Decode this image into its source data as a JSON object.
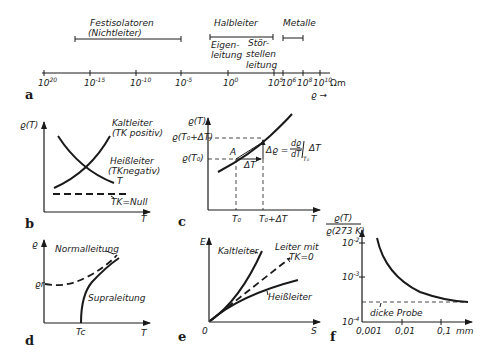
{
  "panels": {
    "a": {
      "label": "a",
      "ranges": {
        "insulators": {
          "line1": "Festisolatoren",
          "line2": "(Nichtleiter)"
        },
        "semiconductors": {
          "title": "Halbleiter",
          "sub1_line1": "Eigen-",
          "sub1_line2": "leitung",
          "sub2_line1": "Stör-",
          "sub2_line2": "stellen",
          "sub2_line3": "leitung"
        },
        "metals": {
          "title": "Metalle"
        }
      },
      "ticks": [
        {
          "base": "10",
          "exp": "20"
        },
        {
          "base": "10",
          "exp": "-15"
        },
        {
          "base": "10",
          "exp": "-10"
        },
        {
          "base": "10",
          "exp": "-5"
        },
        {
          "base": "10",
          "exp": "0"
        },
        {
          "base": "10",
          "exp": "5"
        },
        {
          "base": "10",
          "exp": "6"
        },
        {
          "base": "10",
          "exp": "8"
        },
        {
          "base": "10",
          "exp": "10"
        }
      ],
      "unit": "Ωm",
      "axis_symbol": "ϱ →"
    },
    "b": {
      "label": "b",
      "y_axis": "ϱ(T)",
      "x_axis": "T",
      "curves": {
        "kalt_line1": "Kaltleiter",
        "kalt_line2": "(TK positiv)",
        "heiss_line1": "Heißleiter",
        "heiss_line2": "(TKnegativ)",
        "heiss_line3": "T",
        "null": "TK=Null"
      }
    },
    "c": {
      "label": "c",
      "y_axis": "ϱ(T)",
      "x_axis": "T",
      "y_tick_upper": "ϱ(T₀+ΔT)",
      "y_tick_lower": "ϱ(T₀)",
      "x_tick_1": "T₀",
      "x_tick_2": "T₀+ΔT",
      "point": "A",
      "delta_t": "ΔT",
      "delta_rho": "Δϱ =",
      "derivative_num": "dϱ",
      "derivative_den": "dT",
      "derivative_sub": "T₀",
      "derivative_tail": "ΔT"
    },
    "d": {
      "label": "d",
      "y_axis": "ϱ",
      "x_axis": "T",
      "y_tick": "ϱr",
      "x_tick": "Tc",
      "normal": "Normalleitung",
      "supra": "Supraleitung"
    },
    "e": {
      "label": "e",
      "y_axis": "E",
      "x_axis": "S",
      "origin": "0",
      "kalt": "Kaltleiter",
      "leiter_line1": "Leiter mit",
      "leiter_line2": "TK=0",
      "heiss": "Heißleiter"
    },
    "f": {
      "label": "f",
      "y_axis_num": "ϱ(T)",
      "y_axis_den": "ϱ(273 K)",
      "y_ticks": [
        {
          "base": "10",
          "exp": "-2"
        },
        {
          "base": "10",
          "exp": "-3"
        },
        {
          "base": "10",
          "exp": "-4"
        }
      ],
      "x_ticks": [
        "0,001",
        "0,01",
        "0,1"
      ],
      "x_unit": "mm",
      "thick": "dicke Probe"
    }
  }
}
